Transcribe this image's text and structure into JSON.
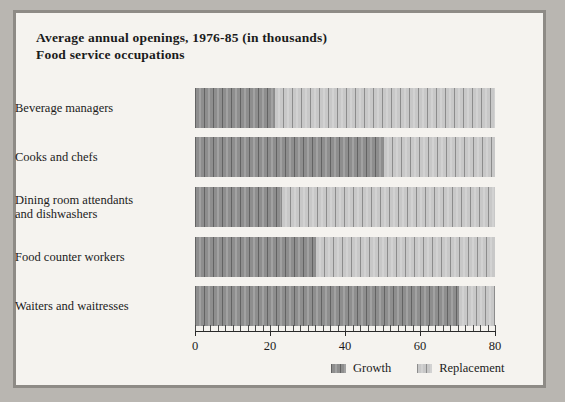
{
  "title": {
    "line1": "Average annual openings, 1976-85 (in thousands)",
    "line2": "Food service occupations"
  },
  "legend": {
    "growth_label": "Growth",
    "replacement_label": "Replacement",
    "growth_color": "#8e8e8e",
    "replacement_color": "#c8c8c8"
  },
  "axis": {
    "ticks": [
      "0",
      "20",
      "40",
      "60",
      "80"
    ]
  },
  "chart_data": {
    "type": "bar",
    "orientation": "horizontal",
    "stacked": true,
    "title": "Average annual openings, 1976-85 (in thousands)",
    "subtitle": "Food service occupations",
    "xlabel": "",
    "ylabel": "",
    "xlim": [
      0,
      80
    ],
    "xticks": [
      0,
      20,
      40,
      60,
      80
    ],
    "grid": false,
    "legend_position": "bottom-right",
    "categories": [
      "Beverage managers",
      "Cooks and chefs",
      "Dining room attendants\nand dishwashers",
      "Food counter workers",
      "Waiters and waitresses"
    ],
    "series": [
      {
        "name": "Growth",
        "values": [
          21,
          50,
          23,
          32,
          70
        ]
      },
      {
        "name": "Replacement",
        "values": [
          59,
          30,
          57,
          48,
          10
        ]
      }
    ],
    "totals": [
      80,
      80,
      80,
      80,
      80
    ]
  }
}
